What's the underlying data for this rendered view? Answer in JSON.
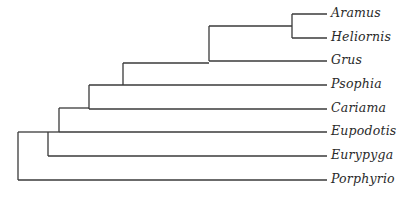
{
  "diagram": {
    "type": "phylogenetic-tree",
    "orientation": "left-to-right",
    "line_color": "#3a3a3a",
    "taxa": [
      {
        "label": "Aramus",
        "y": 14
      },
      {
        "label": "Heliornis",
        "y": 38
      },
      {
        "label": "Grus",
        "y": 61
      },
      {
        "label": "Psophia",
        "y": 85
      },
      {
        "label": "Cariama",
        "y": 109
      },
      {
        "label": "Eupodotis",
        "y": 132
      },
      {
        "label": "Eurypyga",
        "y": 156
      },
      {
        "label": "Porphyrio",
        "y": 180
      }
    ],
    "topology": "(Porphyrio,(Eurypyga,(Eupodotis,(Cariama,(Psophia,(Grus,(Aramus,Heliornis)))))))"
  }
}
